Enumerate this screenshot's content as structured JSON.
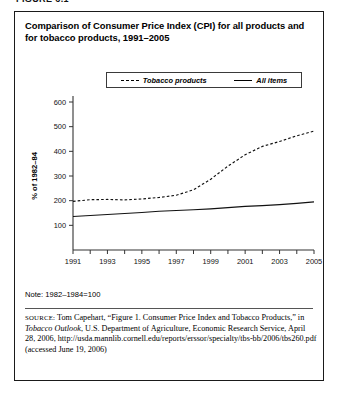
{
  "figure_tag": "FIGURE 6.1",
  "title": "Comparison of Consumer Price Index (CPI) for all products and for tobacco products, 1991–2005",
  "legend": {
    "entries": [
      {
        "label": "Tobacco products",
        "style": "dashed"
      },
      {
        "label": "All items",
        "style": "solid"
      }
    ]
  },
  "note": "Note: 1982–1984=100",
  "source": {
    "prefix": "SOURCE:",
    "part1": " Tom Capehart, “Figure 1. Consumer Price Index and Tobacco Products,” in ",
    "italic1": "Tobacco Outlook",
    "part2": ", U.S. Department of Agriculture, Economic Research Service, April 28, 2006, http://usda.mannlib.cornell.edu/reports/erssor/specialty/tbs-bb/2006/tbs260.pdf (accessed June 19, 2006)"
  },
  "colors": {
    "ink": "#000000",
    "axis": "#333333",
    "box_border": "#1a1a1a"
  },
  "chart_data": {
    "type": "line",
    "title": "Comparison of Consumer Price Index (CPI) for all products and for tobacco products, 1991–2005",
    "xlabel": "",
    "ylabel": "% of 1982–84",
    "xlim": [
      1991,
      2005
    ],
    "ylim": [
      0,
      600
    ],
    "yticks": [
      100,
      200,
      300,
      400,
      500,
      600
    ],
    "xticks": [
      1991,
      1992,
      1993,
      1994,
      1995,
      1996,
      1997,
      1998,
      1999,
      2000,
      2001,
      2002,
      2003,
      2004,
      2005
    ],
    "xtick_labels": [
      "1991",
      "",
      "1993",
      "",
      "1995",
      "",
      "1997",
      "",
      "1999",
      "",
      "2001",
      "",
      "2003",
      "",
      "2005"
    ],
    "grid": false,
    "legend_position": "top-center",
    "x": [
      1991,
      1992,
      1993,
      1994,
      1995,
      1996,
      1997,
      1998,
      1999,
      2000,
      2001,
      2002,
      2003,
      2004,
      2005
    ],
    "series": [
      {
        "name": "Tobacco products",
        "style": "dashed",
        "values": [
          197,
          204,
          205,
          203,
          207,
          213,
          222,
          244,
          287,
          340,
          386,
          420,
          440,
          463,
          482
        ]
      },
      {
        "name": "All items",
        "style": "solid",
        "values": [
          136,
          140,
          144,
          148,
          152,
          157,
          160,
          163,
          167,
          172,
          177,
          180,
          184,
          189,
          195
        ]
      }
    ]
  }
}
